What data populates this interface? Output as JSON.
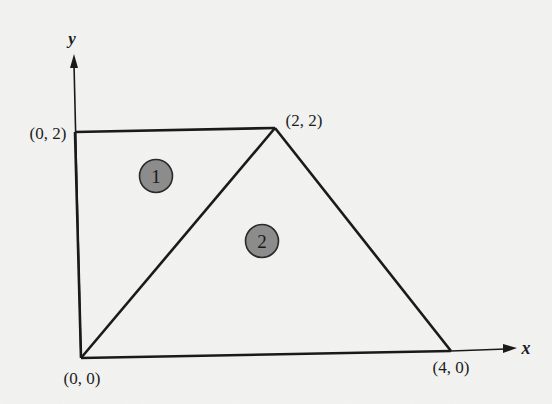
{
  "figure": {
    "axes": {
      "x_label": "x",
      "y_label": "y"
    },
    "vertices": [
      {
        "id": "origin",
        "label": "(0, 0)",
        "x": 0,
        "y": 0
      },
      {
        "id": "top-left",
        "label": "(0, 2)",
        "x": 0,
        "y": 2
      },
      {
        "id": "apex",
        "label": "(2, 2)",
        "x": 2,
        "y": 2
      },
      {
        "id": "right",
        "label": "(4, 0)",
        "x": 4,
        "y": 0
      }
    ],
    "regions": [
      {
        "id": "region-1",
        "label": "1",
        "shape": "triangle",
        "vertices": [
          "(0, 0)",
          "(0, 2)",
          "(2, 2)"
        ]
      },
      {
        "id": "region-2",
        "label": "2",
        "shape": "triangle",
        "vertices": [
          "(0, 0)",
          "(2, 2)",
          "(4, 0)"
        ]
      }
    ],
    "colors": {
      "line": "#1a1a1a",
      "region_marker_fill": "#8c8c8c",
      "background": "#f3f3f2"
    }
  }
}
